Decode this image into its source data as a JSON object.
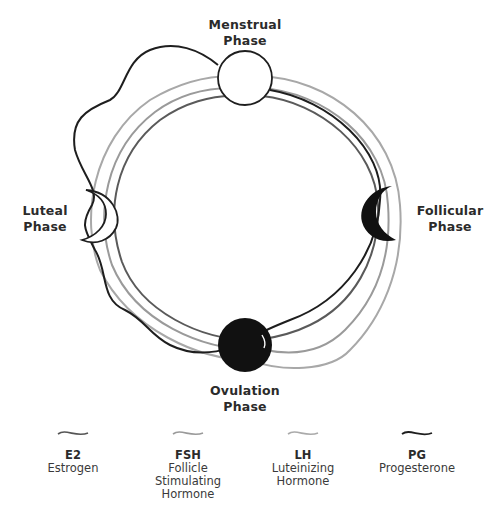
{
  "phases": {
    "menstrual": {
      "line1": "Menstrual",
      "line2": "Phase"
    },
    "follicular": {
      "line1": "Follicular",
      "line2": "Phase"
    },
    "ovulation": {
      "line1": "Ovulation",
      "line2": "Phase"
    },
    "luteal": {
      "line1": "Luteal",
      "line2": "Phase"
    }
  },
  "legend": [
    {
      "abbr": "E2",
      "name_lines": [
        "Estrogen"
      ],
      "color": "#555555"
    },
    {
      "abbr": "FSH",
      "name_lines": [
        "Follicle",
        "Stimulating",
        "Hormone"
      ],
      "color": "#9a9a9a"
    },
    {
      "abbr": "LH",
      "name_lines": [
        "Luteinizing",
        "Hormone"
      ],
      "color": "#aaaaaa"
    },
    {
      "abbr": "PG",
      "name_lines": [
        "Progesterone"
      ],
      "color": "#1e1e1e"
    }
  ],
  "colors": {
    "e2": "#555555",
    "fsh": "#9a9a9a",
    "lh": "#aaaaaa",
    "pg": "#1e1e1e",
    "text": "#2b2b2b"
  }
}
